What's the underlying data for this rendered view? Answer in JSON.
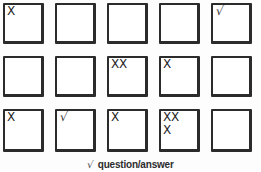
{
  "sheet": {
    "title": "Checkbox tally grid",
    "rows": 3,
    "columns": 5,
    "ink_color": "#2b2b2b",
    "background_color": "#fdfdfd"
  },
  "legend": {
    "check_glyph": "√",
    "text": "question/answer"
  },
  "grid": {
    "rows": [
      {
        "row_label": "row-1",
        "cells": [
          {
            "id": "r1c1",
            "marks": [
              "X"
            ],
            "type": "cross"
          },
          {
            "id": "r1c2",
            "marks": [],
            "type": "empty"
          },
          {
            "id": "r1c3",
            "marks": [],
            "type": "empty"
          },
          {
            "id": "r1c4",
            "marks": [],
            "type": "empty"
          },
          {
            "id": "r1c5",
            "marks": [
              "√"
            ],
            "type": "check"
          }
        ]
      },
      {
        "row_label": "row-2",
        "cells": [
          {
            "id": "r2c1",
            "marks": [],
            "type": "empty"
          },
          {
            "id": "r2c2",
            "marks": [],
            "type": "empty"
          },
          {
            "id": "r2c3",
            "marks": [
              "XX"
            ],
            "type": "cross"
          },
          {
            "id": "r2c4",
            "marks": [
              "X"
            ],
            "type": "cross"
          },
          {
            "id": "r2c5",
            "marks": [],
            "type": "empty"
          }
        ]
      },
      {
        "row_label": "row-3",
        "cells": [
          {
            "id": "r3c1",
            "marks": [
              "X"
            ],
            "type": "cross"
          },
          {
            "id": "r3c2",
            "marks": [
              "√"
            ],
            "type": "check"
          },
          {
            "id": "r3c3",
            "marks": [
              "X"
            ],
            "type": "cross"
          },
          {
            "id": "r3c4",
            "marks": [
              "XX",
              "X"
            ],
            "type": "cross"
          },
          {
            "id": "r3c5",
            "marks": [],
            "type": "empty"
          }
        ]
      }
    ]
  }
}
